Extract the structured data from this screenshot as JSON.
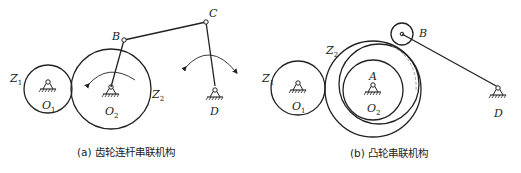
{
  "figures": [
    {
      "id": "a",
      "caption": "(a) 齿轮连杆串联机构",
      "labels": {
        "Z1": {
          "main": "Z",
          "sub": "1"
        },
        "Z2": {
          "main": "Z",
          "sub": "2"
        },
        "O1": {
          "main": "O",
          "sub": "1"
        },
        "O2": {
          "main": "O",
          "sub": "2"
        },
        "B": "B",
        "C": "C",
        "D": "D"
      }
    },
    {
      "id": "b",
      "caption": "(b) 凸轮串联机构",
      "labels": {
        "Z1": {
          "main": "Z",
          "sub": "1"
        },
        "Z2": {
          "main": "Z",
          "sub": "2"
        },
        "O1": {
          "main": "O",
          "sub": "1"
        },
        "O2": {
          "main": "O",
          "sub": "2"
        },
        "A": "A",
        "B": "B",
        "D": "D"
      }
    }
  ]
}
